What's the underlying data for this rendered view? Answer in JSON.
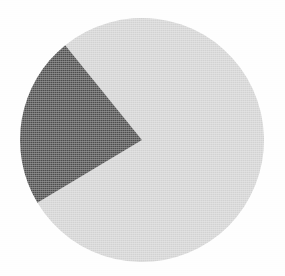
{
  "chart_data": {
    "type": "pie",
    "title": "",
    "subtitle": "",
    "xlabel": "",
    "ylabel": "",
    "grid": false,
    "legend_position": "none",
    "labels": [
      "Light slice",
      "Dark slice"
    ],
    "values": [
      78,
      22
    ],
    "value_unit": "%",
    "colors": [
      "#d2d2d2",
      "#4d4d4d"
    ],
    "slices": [
      {
        "name": "light-slice",
        "label": "Light slice",
        "value": 78,
        "percent": "78%",
        "color": "#d2d2d2",
        "start_angle_deg": 211,
        "end_angle_deg": 489,
        "sweep_deg": 278
      },
      {
        "name": "dark-slice",
        "label": "Dark slice",
        "value": 22,
        "percent": "22%",
        "color": "#4d4d4d",
        "start_angle_deg": 129,
        "end_angle_deg": 211,
        "sweep_deg": 82
      }
    ],
    "geometry": {
      "center_x": 142,
      "center_y": 140,
      "radius": 122
    },
    "background_color": "#fdfdfd",
    "outline": "none",
    "data_labels_shown": false,
    "axis_shown": false
  },
  "figure": {
    "name": "pie-chart",
    "width": 285,
    "height": 276
  }
}
